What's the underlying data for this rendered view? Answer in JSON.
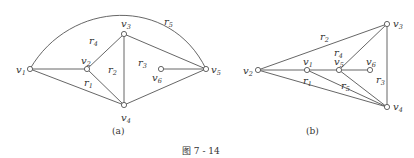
{
  "figure": {
    "caption": "图 7 - 14",
    "subfigures": [
      {
        "id": "a",
        "label": "(a)",
        "vertices": [
          {
            "name": "v",
            "sub": "1",
            "x": 30,
            "y": 69
          },
          {
            "name": "v",
            "sub": "2",
            "x": 87,
            "y": 69
          },
          {
            "name": "v",
            "sub": "3",
            "x": 124,
            "y": 34
          },
          {
            "name": "v",
            "sub": "4",
            "x": 124,
            "y": 105
          },
          {
            "name": "v",
            "sub": "5",
            "x": 206,
            "y": 69
          },
          {
            "name": "v",
            "sub": "6",
            "x": 161,
            "y": 69
          }
        ],
        "regions": [
          {
            "name": "r",
            "sub": "1",
            "x": 84,
            "y": 86
          },
          {
            "name": "r",
            "sub": "2",
            "x": 108,
            "y": 73
          },
          {
            "name": "r",
            "sub": "3",
            "x": 138,
            "y": 66
          },
          {
            "name": "r",
            "sub": "4",
            "x": 89,
            "y": 44
          },
          {
            "name": "r",
            "sub": "5",
            "x": 164,
            "y": 25
          }
        ]
      },
      {
        "id": "b",
        "label": "(b)",
        "vertices": [
          {
            "name": "v",
            "sub": "2",
            "x": 258,
            "y": 70
          },
          {
            "name": "v",
            "sub": "1",
            "x": 307,
            "y": 70
          },
          {
            "name": "v",
            "sub": "5",
            "x": 339,
            "y": 70
          },
          {
            "name": "v",
            "sub": "6",
            "x": 370,
            "y": 70
          },
          {
            "name": "v",
            "sub": "3",
            "x": 387,
            "y": 24
          },
          {
            "name": "v",
            "sub": "4",
            "x": 387,
            "y": 107
          }
        ],
        "regions": [
          {
            "name": "r",
            "sub": "1",
            "x": 303,
            "y": 84
          },
          {
            "name": "r",
            "sub": "2",
            "x": 320,
            "y": 40
          },
          {
            "name": "r",
            "sub": "3",
            "x": 376,
            "y": 83
          },
          {
            "name": "r",
            "sub": "4",
            "x": 334,
            "y": 56
          },
          {
            "name": "r",
            "sub": "5",
            "x": 341,
            "y": 89
          }
        ]
      }
    ]
  }
}
